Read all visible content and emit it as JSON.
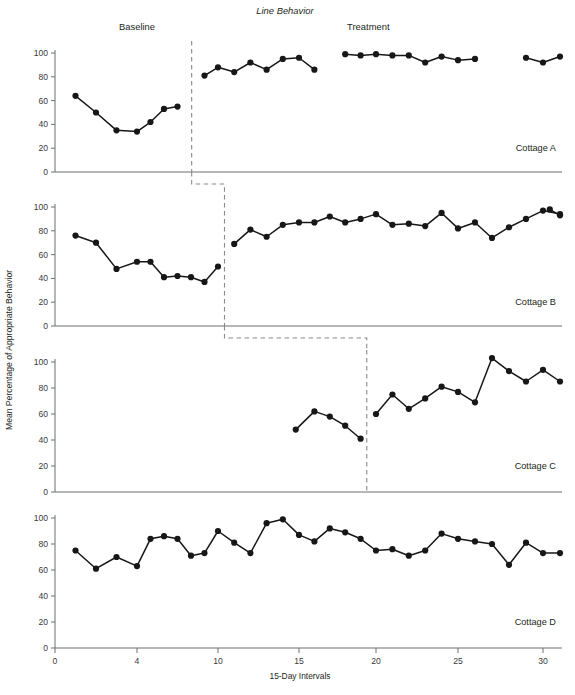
{
  "chart_data": {
    "type": "line",
    "title": "Line Behavior",
    "xlabel": "15-Day Intervals",
    "ylabel": "Mean Percentage of Appropriate Behavior",
    "xlim": [
      0,
      31
    ],
    "ylim": [
      0,
      108
    ],
    "ytick_values": [
      0,
      20,
      40,
      60,
      80,
      100
    ],
    "ytick_labels": [
      "0",
      "20",
      "40",
      "60",
      "80",
      "100"
    ],
    "xtick_values": [
      0,
      4,
      10,
      15,
      20,
      25,
      30
    ],
    "xtick_labels": [
      "0",
      "4",
      "10",
      "15",
      "20",
      "25",
      "30"
    ],
    "grid": false,
    "legend": "none",
    "phase_labels": [
      {
        "text": "Baseline",
        "x_data": 4.0
      },
      {
        "text": "Treatment",
        "x_data": 19.5
      }
    ],
    "panels": [
      {
        "name": "Cottage A",
        "tag": "Cottage A",
        "phase_change_x": 8.05,
        "segments": [
          {
            "phase": "baseline",
            "x": [
              1,
              2,
              3,
              4,
              5,
              6,
              7
            ],
            "y": [
              64,
              50,
              35,
              34,
              42,
              53,
              55
            ]
          },
          {
            "phase": "treatment",
            "x": [
              9,
              10,
              11,
              12,
              13,
              14,
              15,
              16
            ],
            "y": [
              81,
              88,
              84,
              92,
              86,
              95,
              96,
              86
            ]
          },
          {
            "phase": "treatment",
            "x": [
              18,
              19,
              20,
              21,
              22,
              23,
              24,
              25,
              26
            ],
            "y": [
              99,
              98,
              99,
              98,
              98,
              92,
              97,
              94,
              95
            ]
          },
          {
            "phase": "treatment",
            "x": [
              29,
              30,
              31
            ],
            "y": [
              96,
              92,
              97
            ]
          }
        ]
      },
      {
        "name": "Cottage B",
        "tag": "Cottage B",
        "phase_change_x": 10.4,
        "segments": [
          {
            "phase": "baseline",
            "x": [
              1,
              2,
              3,
              4,
              5,
              6,
              7,
              8,
              9,
              10
            ],
            "y": [
              76,
              70,
              48,
              54,
              54,
              41,
              42,
              41,
              37,
              50
            ]
          },
          {
            "phase": "treatment",
            "x": [
              11,
              12,
              13,
              14,
              15,
              16,
              17,
              18,
              19,
              20,
              21,
              22,
              23,
              24,
              25,
              26,
              27,
              28,
              29,
              30,
              31
            ],
            "y": [
              69,
              81,
              75,
              85,
              87,
              87,
              92,
              87,
              90,
              94,
              85,
              86,
              84,
              95,
              82,
              87,
              74,
              83,
              90,
              97,
              94
            ]
          },
          {
            "phase": "treatment",
            "x": [
              30.4,
              31
            ],
            "y": [
              98,
              93
            ]
          }
        ]
      },
      {
        "name": "Cottage C",
        "tag": "Cottage C",
        "phase_change_x": 19.4,
        "segments": [
          {
            "phase": "baseline",
            "x": [
              14.8,
              16,
              17,
              18,
              19
            ],
            "y": [
              48,
              62,
              58,
              51,
              41
            ]
          },
          {
            "phase": "treatment",
            "x": [
              20,
              21,
              22,
              23,
              24,
              25,
              26,
              27,
              28,
              29,
              30,
              31
            ],
            "y": [
              60,
              75,
              64,
              72,
              81,
              77,
              69,
              103,
              93,
              85,
              94,
              85
            ]
          }
        ]
      },
      {
        "name": "Cottage D",
        "tag": "Cottage D",
        "phase_change_x": null,
        "segments": [
          {
            "phase": "continuous",
            "x": [
              1,
              2,
              3,
              4,
              5,
              6,
              7,
              8,
              9,
              10,
              11,
              12,
              13,
              14,
              15,
              16,
              17,
              18,
              19,
              20,
              21,
              22,
              23,
              24,
              25,
              26,
              27,
              28,
              29,
              30,
              31
            ],
            "y": [
              75,
              61,
              70,
              63,
              84,
              86,
              84,
              71,
              73,
              90,
              81,
              73,
              96,
              99,
              87,
              82,
              92,
              89,
              84,
              75,
              76,
              71,
              75,
              88,
              84,
              82,
              80,
              64,
              81,
              73,
              73
            ]
          }
        ]
      }
    ],
    "step_connectors": [
      {
        "from_panel": "Cottage A",
        "to_panel": "Cottage B",
        "x_start": 8.05,
        "x_end": 10.4
      },
      {
        "from_panel": "Cottage B",
        "to_panel": "Cottage C",
        "x_start": 10.4,
        "x_end": 19.4
      }
    ]
  },
  "caption": {
    "text": "",
    "visible": false
  }
}
